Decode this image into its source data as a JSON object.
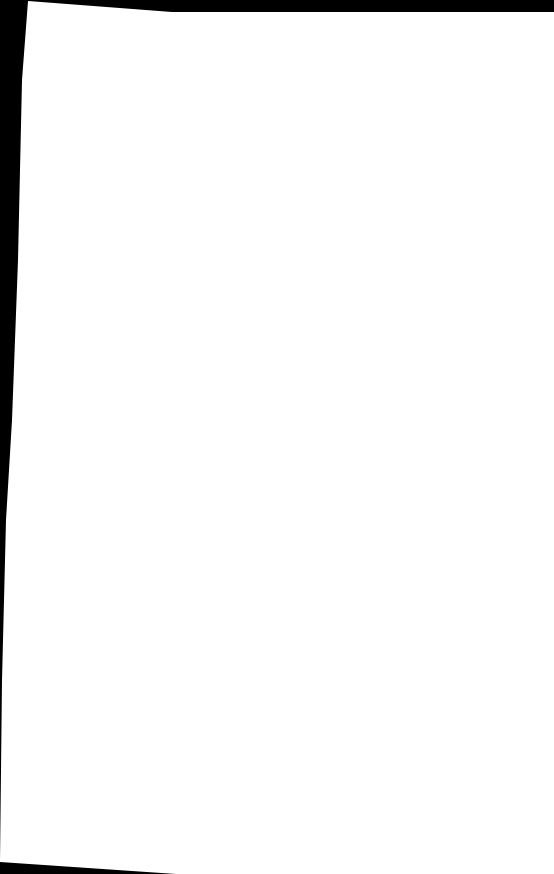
{
  "document": {
    "type": "scanned-page",
    "content": "",
    "colors": {
      "page": "#ffffff",
      "border": "#000000"
    }
  }
}
